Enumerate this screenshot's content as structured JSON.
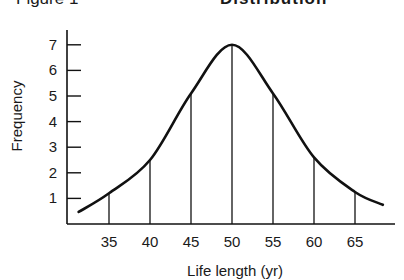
{
  "header": {
    "figure_label": "Figure 1",
    "title": "Distribution"
  },
  "chart_data": {
    "type": "line",
    "title": "Distribution",
    "xlabel": "Life length (yr)",
    "ylabel": "Frequency",
    "x_ticks": [
      "35",
      "40",
      "45",
      "50",
      "55",
      "60",
      "65"
    ],
    "y_ticks": [
      "1",
      "2",
      "3",
      "4",
      "5",
      "6",
      "7"
    ],
    "xlim": [
      31,
      69
    ],
    "ylim": [
      0,
      7.5
    ],
    "grid": false,
    "legend": null,
    "curve": {
      "x": [
        31.3,
        35,
        40,
        45,
        50,
        55,
        60,
        65,
        68.4
      ],
      "y": [
        0.47,
        1.2,
        2.5,
        5.1,
        7.0,
        5.1,
        2.6,
        1.25,
        0.75
      ]
    },
    "vertical_lines": {
      "x": [
        35,
        40,
        45,
        50,
        55,
        60,
        65
      ],
      "y": [
        1.2,
        2.5,
        5.1,
        7.0,
        5.1,
        2.6,
        1.25
      ]
    }
  }
}
